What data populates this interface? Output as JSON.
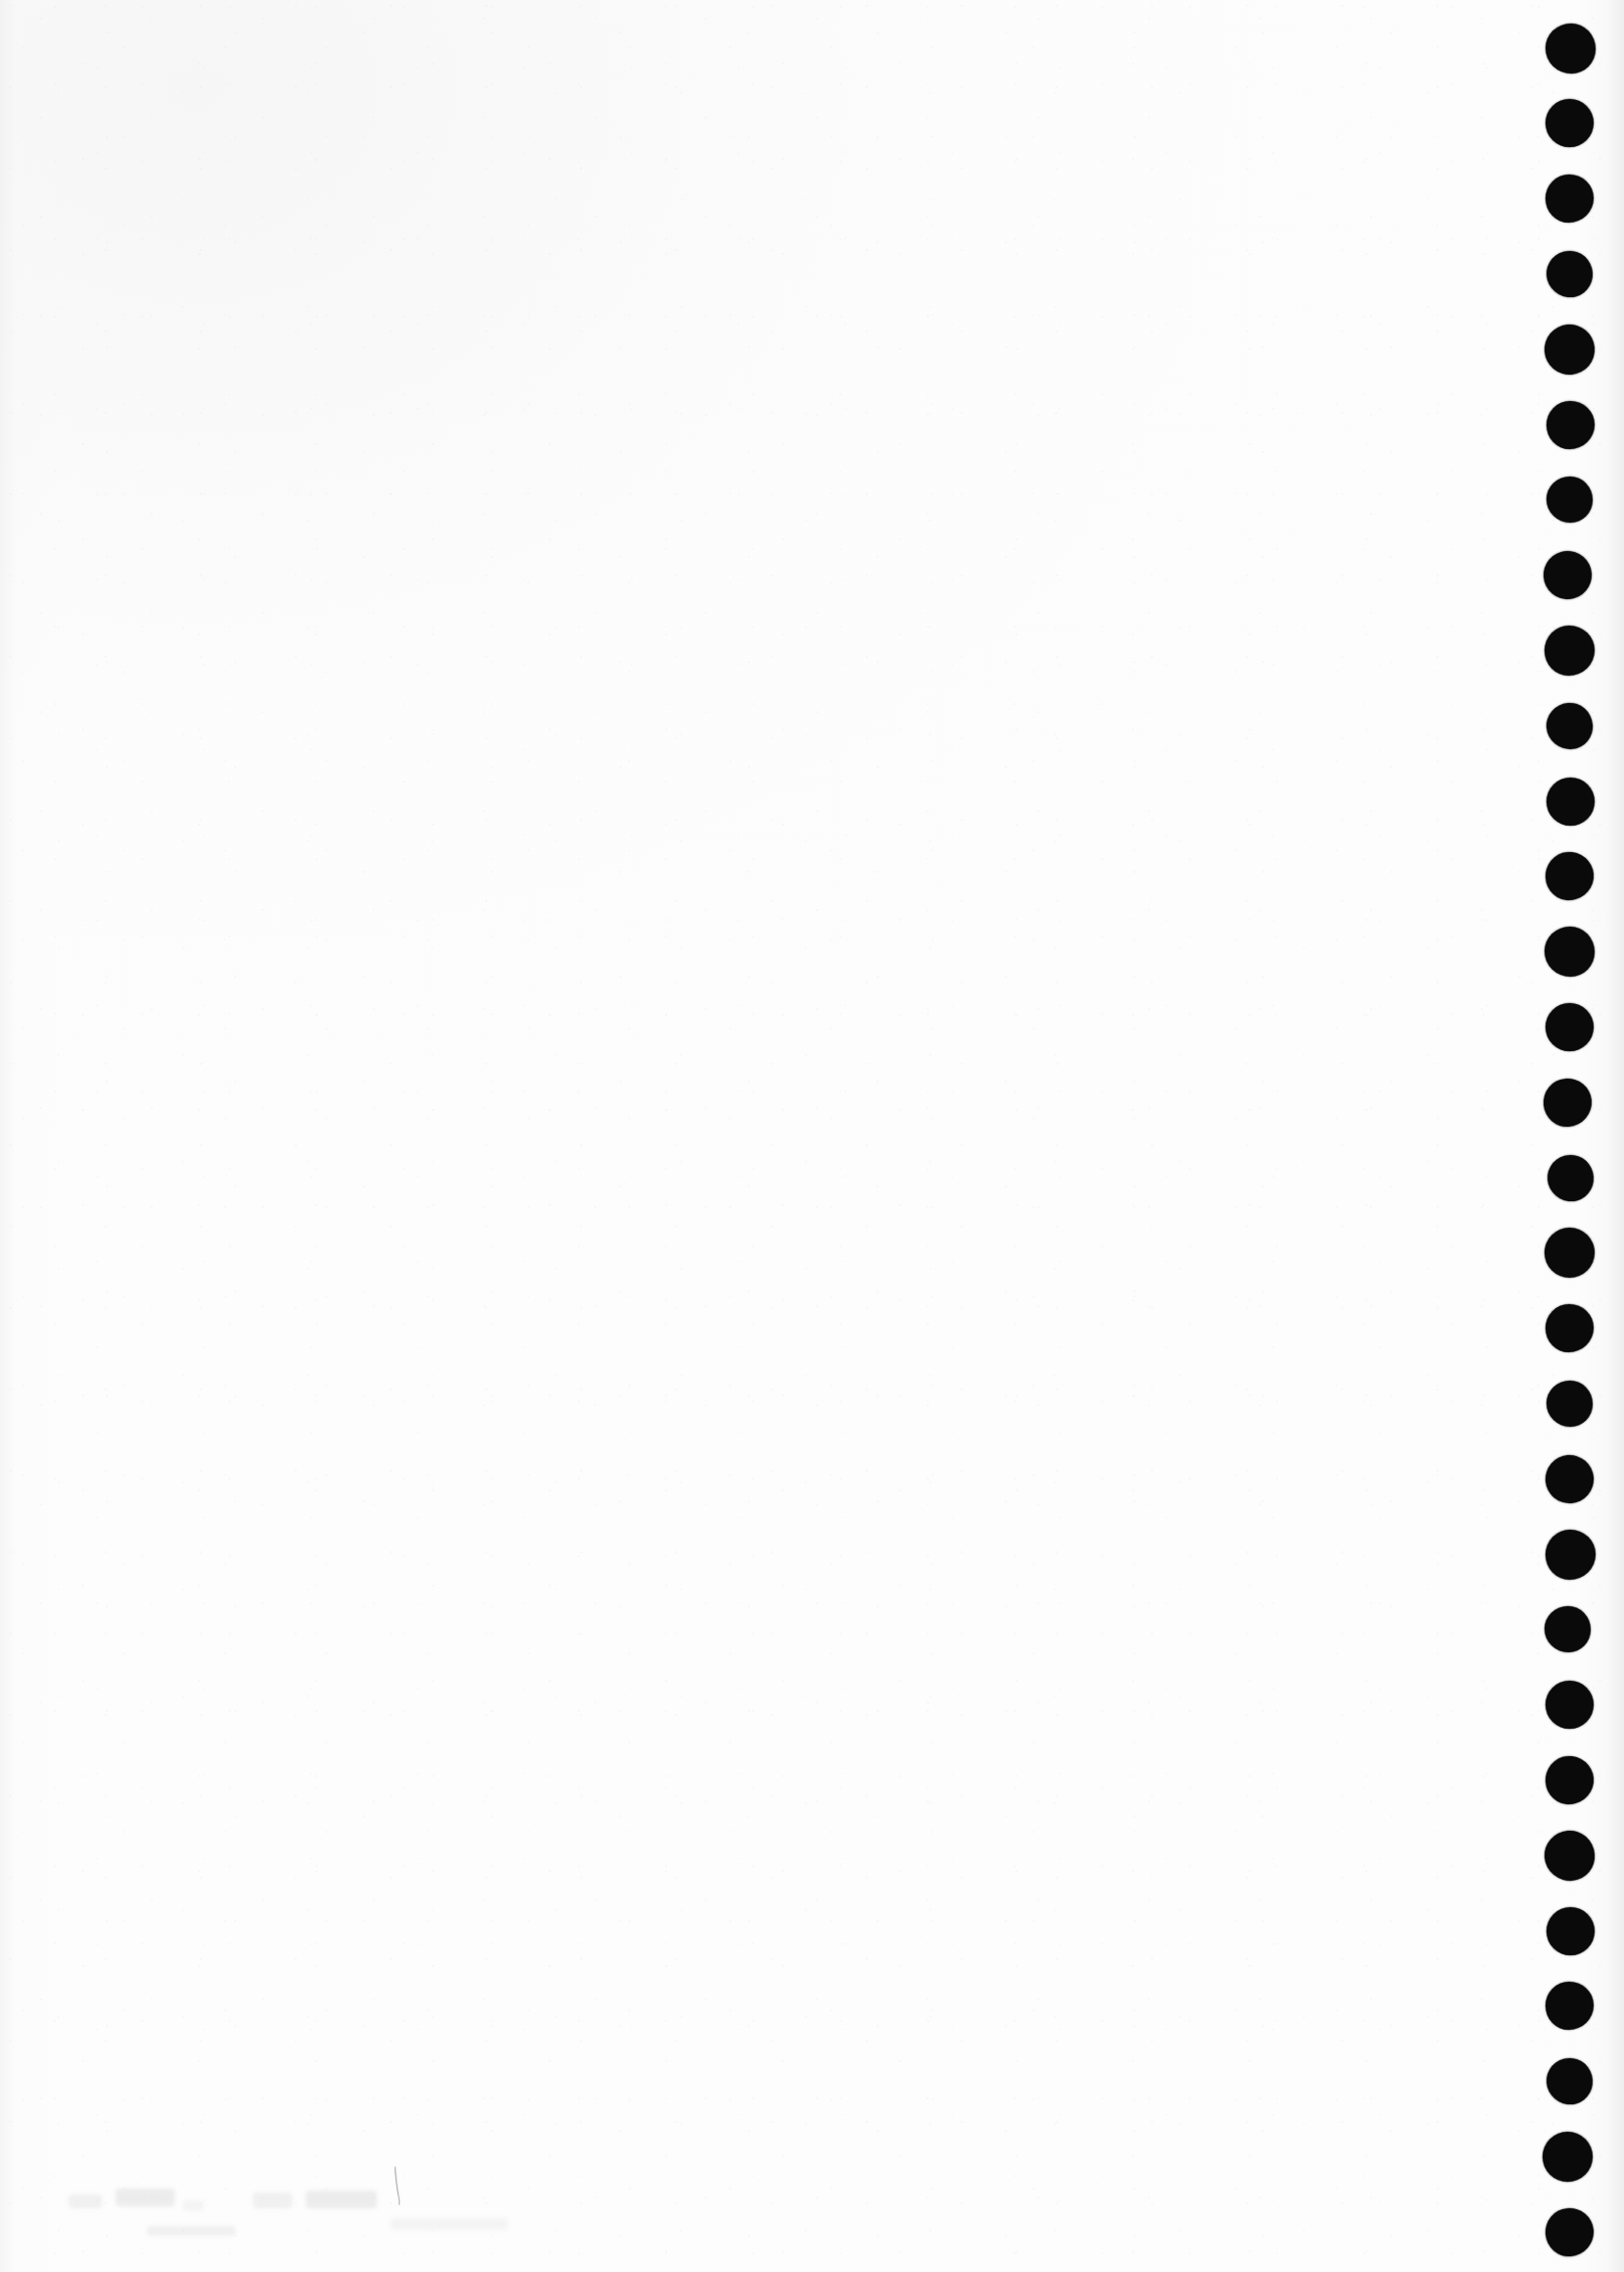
{
  "document": {
    "title": "Scanned page",
    "page_label": "",
    "page_kind": "blank-verso",
    "visible_text": "",
    "note": "Blank scanned page; no printed or legible handwritten text is present."
  },
  "canvas": {
    "width": 1656,
    "height": 2317,
    "background_color": "#fdfdfd",
    "ink_color": "#0a0a0a",
    "edge_shadow_color": "#e2e2e4"
  },
  "binding_holes": {
    "name": "punch-hole-column",
    "count": 30,
    "color": "#0a0a0a",
    "center_x": 1600,
    "first_center_y": 49,
    "spacing_y": 76.8,
    "diameter": 49,
    "side": "right"
  },
  "pencil_mark": {
    "name": "faint-pencil-stroke",
    "color": "#9a9aa0",
    "x": 396,
    "y": 2212,
    "width": 16,
    "height": 36,
    "opacity": 0.45
  },
  "ghost_smudges": [
    {
      "x": 70,
      "y": 2238,
      "width": 34,
      "height": 14
    },
    {
      "x": 118,
      "y": 2232,
      "width": 60,
      "height": 18
    },
    {
      "x": 186,
      "y": 2244,
      "width": 22,
      "height": 11
    },
    {
      "x": 258,
      "y": 2236,
      "width": 40,
      "height": 16
    },
    {
      "x": 312,
      "y": 2234,
      "width": 72,
      "height": 18
    },
    {
      "x": 398,
      "y": 2262,
      "width": 120,
      "height": 12
    },
    {
      "x": 150,
      "y": 2270,
      "width": 90,
      "height": 10
    }
  ],
  "content_area": {
    "name": "page-content-area",
    "left": 130,
    "top": 150,
    "width": 1310,
    "height": 2020,
    "text": ""
  }
}
